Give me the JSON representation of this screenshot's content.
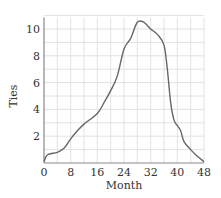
{
  "chart_data": {
    "type": "line",
    "title": "",
    "xlabel": "Month",
    "ylabel": "Ties",
    "xlim": [
      0,
      48
    ],
    "ylim": [
      0,
      11
    ],
    "xticks": [
      0,
      8,
      16,
      24,
      32,
      40,
      48
    ],
    "yticks": [
      2,
      4,
      6,
      8,
      10
    ],
    "grid": true,
    "legend": null,
    "series": [
      {
        "name": "Ties",
        "color": "#666666",
        "x": [
          0,
          1,
          4,
          6,
          8,
          10,
          12,
          16,
          18,
          20,
          22,
          24,
          26,
          28,
          30,
          32,
          34,
          36,
          37,
          38,
          39,
          40,
          41,
          42,
          44,
          46,
          48
        ],
        "y": [
          0.1,
          0.6,
          0.8,
          1.1,
          1.8,
          2.4,
          2.9,
          3.7,
          4.5,
          5.4,
          6.5,
          8.5,
          9.3,
          10.5,
          10.5,
          10.0,
          9.6,
          8.8,
          7.0,
          4.5,
          3.2,
          2.8,
          2.4,
          1.6,
          1.0,
          0.5,
          0.1
        ]
      }
    ]
  },
  "labels": {
    "x": "Month",
    "y": "Ties"
  }
}
